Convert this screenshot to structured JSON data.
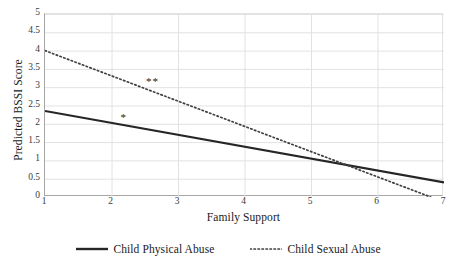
{
  "chart_data": {
    "type": "line",
    "title": "",
    "xlabel": "Family Support",
    "ylabel": "Predicted BSSI Score",
    "xlim": [
      1,
      7
    ],
    "ylim": [
      0,
      5
    ],
    "x_ticks": [
      1,
      2,
      3,
      4,
      5,
      6,
      7
    ],
    "x_tick_labels": [
      "1",
      "2",
      "3",
      "4",
      "5",
      "6",
      "7"
    ],
    "y_ticks": [
      0,
      0.5,
      1,
      1.5,
      2,
      2.5,
      3,
      3.5,
      4,
      4.5,
      5
    ],
    "y_tick_labels": [
      "0",
      "0.5",
      "1",
      "1.5",
      "2",
      "2.5",
      "3",
      "3.5",
      "4",
      "4.5",
      "5"
    ],
    "grid": "horizontal-and-vertical",
    "legend_position": "bottom",
    "series": [
      {
        "name": "Child Physical Abuse",
        "style": "solid",
        "color": "#262626",
        "x": [
          1,
          7
        ],
        "values": [
          2.35,
          0.4
        ]
      },
      {
        "name": "Child Sexual Abuse",
        "style": "dotted",
        "color": "#404040",
        "x": [
          1,
          6.8
        ],
        "values": [
          4.0,
          0.0
        ]
      }
    ],
    "annotations": [
      {
        "text": "*",
        "x": 2.2,
        "y": 2.15,
        "series": "Child Physical Abuse"
      },
      {
        "text": "**",
        "x": 2.63,
        "y": 3.13,
        "series": "Child Sexual Abuse"
      }
    ]
  },
  "legend": {
    "entries": [
      {
        "label": "Child Physical Abuse",
        "style": "solid"
      },
      {
        "label": "Child Sexual Abuse",
        "style": "dotted"
      }
    ]
  },
  "colors": {
    "solid_line": "#262626",
    "dotted_line": "#404040",
    "axis": "#a6a6a6",
    "grid": "#e2e2e2",
    "text": "#1a1a1a",
    "tick_text": "#3a3a3a",
    "background": "#ffffff"
  }
}
